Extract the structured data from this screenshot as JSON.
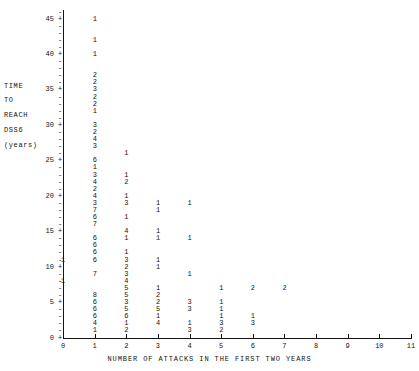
{
  "chart_data": {
    "type": "scatter",
    "title": "",
    "subtitle": "",
    "xlabel": "NUMBER OF ATTACKS IN THE FIRST TWO YEARS",
    "ylabel": "TIME TO REACH DSS6 (years)",
    "ylabel_lines": [
      "TIME",
      "TO",
      "REACH",
      "DSS6",
      "(years)"
    ],
    "xlim": [
      0,
      11
    ],
    "ylim": [
      0,
      46
    ],
    "xticks": [
      0,
      1,
      2,
      3,
      4,
      5,
      6,
      7,
      8,
      9,
      10,
      11
    ],
    "xtick_labels": [
      "0",
      "1",
      "2",
      "3",
      "4",
      "5",
      "6",
      "7",
      "8",
      "9",
      "10",
      "11"
    ],
    "yticks": [
      0,
      5,
      10,
      15,
      20,
      25,
      30,
      35,
      40,
      45
    ],
    "ytick_labels": [
      "0",
      "5",
      "10",
      "15",
      "20",
      "25",
      "30",
      "35",
      "40",
      "45"
    ],
    "y_minor_step": 1,
    "grid": false,
    "legend": null,
    "plot_style": "character-count-plot",
    "note": "Each printed character is the count of patients in that cell; '+' marks a y-axis major tick row.",
    "points": [
      {
        "x": 1,
        "y": 45,
        "label": "1"
      },
      {
        "x": 1,
        "y": 42,
        "label": "1"
      },
      {
        "x": 1,
        "y": 40,
        "label": "1"
      },
      {
        "x": 1,
        "y": 37,
        "label": "2"
      },
      {
        "x": 1,
        "y": 36,
        "label": "2"
      },
      {
        "x": 1,
        "y": 35,
        "label": "3"
      },
      {
        "x": 1,
        "y": 34,
        "label": "2"
      },
      {
        "x": 1,
        "y": 33,
        "label": "2"
      },
      {
        "x": 1,
        "y": 32,
        "label": "1"
      },
      {
        "x": 1,
        "y": 30,
        "label": "3"
      },
      {
        "x": 1,
        "y": 29,
        "label": "2"
      },
      {
        "x": 1,
        "y": 28,
        "label": "4"
      },
      {
        "x": 1,
        "y": 27,
        "label": "3"
      },
      {
        "x": 1,
        "y": 25,
        "label": "6"
      },
      {
        "x": 1,
        "y": 24,
        "label": "1"
      },
      {
        "x": 1,
        "y": 23,
        "label": "3"
      },
      {
        "x": 1,
        "y": 22,
        "label": "4"
      },
      {
        "x": 1,
        "y": 21,
        "label": "2"
      },
      {
        "x": 1,
        "y": 20,
        "label": "4"
      },
      {
        "x": 1,
        "y": 19,
        "label": "3"
      },
      {
        "x": 1,
        "y": 18,
        "label": "7"
      },
      {
        "x": 1,
        "y": 17,
        "label": "6"
      },
      {
        "x": 1,
        "y": 16,
        "label": "7"
      },
      {
        "x": 1,
        "y": 14,
        "label": "6"
      },
      {
        "x": 1,
        "y": 13,
        "label": "6"
      },
      {
        "x": 1,
        "y": 12,
        "label": "6"
      },
      {
        "x": 1,
        "y": 11,
        "label": "6"
      },
      {
        "x": 1,
        "y": 9,
        "label": "7"
      },
      {
        "x": 1,
        "y": 6,
        "label": "8"
      },
      {
        "x": 1,
        "y": 5,
        "label": "6"
      },
      {
        "x": 1,
        "y": 4,
        "label": "6"
      },
      {
        "x": 1,
        "y": 3,
        "label": "6"
      },
      {
        "x": 1,
        "y": 2,
        "label": "4"
      },
      {
        "x": 1,
        "y": 1,
        "label": "1"
      },
      {
        "x": 2,
        "y": 26,
        "label": "1"
      },
      {
        "x": 2,
        "y": 23,
        "label": "1"
      },
      {
        "x": 2,
        "y": 22,
        "label": "2"
      },
      {
        "x": 2,
        "y": 20,
        "label": "1"
      },
      {
        "x": 2,
        "y": 19,
        "label": "3"
      },
      {
        "x": 2,
        "y": 17,
        "label": "1"
      },
      {
        "x": 2,
        "y": 15,
        "label": "4"
      },
      {
        "x": 2,
        "y": 14,
        "label": "1"
      },
      {
        "x": 2,
        "y": 12,
        "label": "1"
      },
      {
        "x": 2,
        "y": 11,
        "label": "3"
      },
      {
        "x": 2,
        "y": 10,
        "label": "2"
      },
      {
        "x": 2,
        "y": 9,
        "label": "3"
      },
      {
        "x": 2,
        "y": 8,
        "label": "4"
      },
      {
        "x": 2,
        "y": 7,
        "label": "5"
      },
      {
        "x": 2,
        "y": 6,
        "label": "5"
      },
      {
        "x": 2,
        "y": 5,
        "label": "3"
      },
      {
        "x": 2,
        "y": 4,
        "label": "5"
      },
      {
        "x": 2,
        "y": 3,
        "label": "6"
      },
      {
        "x": 2,
        "y": 2,
        "label": "1"
      },
      {
        "x": 2,
        "y": 1,
        "label": "2"
      },
      {
        "x": 3,
        "y": 19,
        "label": "1"
      },
      {
        "x": 3,
        "y": 18,
        "label": "1"
      },
      {
        "x": 3,
        "y": 15,
        "label": "1"
      },
      {
        "x": 3,
        "y": 14,
        "label": "1"
      },
      {
        "x": 3,
        "y": 11,
        "label": "1"
      },
      {
        "x": 3,
        "y": 10,
        "label": "1"
      },
      {
        "x": 3,
        "y": 7,
        "label": "1"
      },
      {
        "x": 3,
        "y": 6,
        "label": "2"
      },
      {
        "x": 3,
        "y": 5,
        "label": "2"
      },
      {
        "x": 3,
        "y": 4,
        "label": "5"
      },
      {
        "x": 3,
        "y": 3,
        "label": "1"
      },
      {
        "x": 3,
        "y": 2,
        "label": "4"
      },
      {
        "x": 4,
        "y": 19,
        "label": "1"
      },
      {
        "x": 4,
        "y": 14,
        "label": "1"
      },
      {
        "x": 4,
        "y": 9,
        "label": "1"
      },
      {
        "x": 4,
        "y": 5,
        "label": "3"
      },
      {
        "x": 4,
        "y": 4,
        "label": "3"
      },
      {
        "x": 4,
        "y": 2,
        "label": "1"
      },
      {
        "x": 4,
        "y": 1,
        "label": "3"
      },
      {
        "x": 5,
        "y": 7,
        "label": "1"
      },
      {
        "x": 5,
        "y": 5,
        "label": "1"
      },
      {
        "x": 5,
        "y": 4,
        "label": "1"
      },
      {
        "x": 5,
        "y": 3,
        "label": "1"
      },
      {
        "x": 5,
        "y": 2,
        "label": "3"
      },
      {
        "x": 5,
        "y": 1,
        "label": "2"
      },
      {
        "x": 6,
        "y": 7,
        "label": "2"
      },
      {
        "x": 6,
        "y": 3,
        "label": "1"
      },
      {
        "x": 6,
        "y": 2,
        "label": "3"
      },
      {
        "x": 7,
        "y": 7,
        "label": "2"
      },
      {
        "x": 0,
        "y": 11,
        "label": "1"
      },
      {
        "x": 0,
        "y": 8,
        "label": "1"
      }
    ]
  }
}
